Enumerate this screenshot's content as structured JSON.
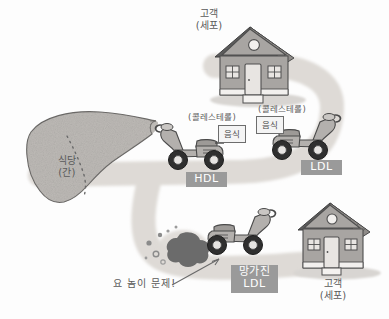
{
  "diagram": {
    "title_alt": "Cholesterol transport analogy diagram",
    "colors": {
      "road": "#dedad6",
      "badge_bg": "#9a9a9a",
      "badge_text": "#ffffff",
      "text": "#5a5a5a",
      "house_wall": "#a8a5a2",
      "house_roof": "#595959",
      "liver_fill": "#bdbab6",
      "scooter_body": "#b3b0ad",
      "smoke": "#6b6b6b",
      "background": "#fdfdfd"
    },
    "labels": {
      "liver": {
        "line1": "식당",
        "line2": "(간)"
      },
      "house_top": {
        "line1": "고객",
        "line2": "(세포)"
      },
      "house_bottom": {
        "line1": "고객",
        "line2": "(세포)"
      },
      "cholesterol_hdl": "(콜레스테롤)",
      "cholesterol_ldl": "(콜레스테롤)",
      "food_box_hdl": "음식",
      "food_box_ldl": "음식",
      "annotation": "요 놈이 문제!"
    },
    "badges": [
      {
        "id": "hdl",
        "line1": "HDL",
        "line2": ""
      },
      {
        "id": "ldl",
        "line1": "LDL",
        "line2": ""
      },
      {
        "id": "broken-ldl",
        "line1": "망가진",
        "line2": "LDL"
      }
    ],
    "vehicles": [
      {
        "id": "hdl-scooter",
        "facing": "left",
        "state": "normal",
        "carries": "음식"
      },
      {
        "id": "ldl-scooter",
        "facing": "right",
        "state": "normal",
        "carries": "음식"
      },
      {
        "id": "broken-ldl-scooter",
        "facing": "right",
        "state": "damaged",
        "carries": ""
      }
    ]
  }
}
